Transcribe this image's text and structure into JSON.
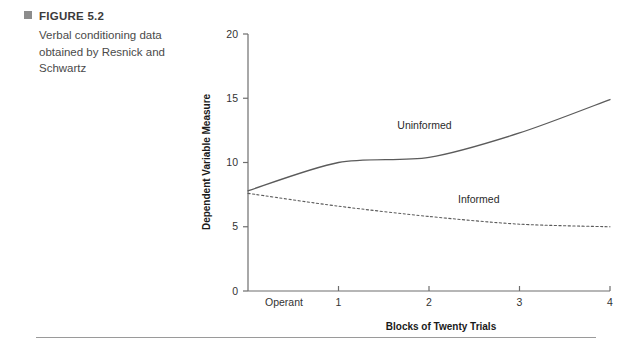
{
  "figure": {
    "bullet_icon": "square-bullet-icon",
    "title": "FIGURE 5.2",
    "description": "Verbal conditioning data obtained by Resnick and Schwartz"
  },
  "footer": {
    "faint_text": ""
  },
  "colors": {
    "axis": "#6e6e6e",
    "line": "#5b5b5b",
    "bullet": "#8c8c8c",
    "text": "#231f20"
  },
  "chart_data": {
    "type": "line",
    "title": "",
    "xlabel": "Blocks of Twenty Trials",
    "ylabel": "Dependent Variable Measure",
    "categories": [
      "Operant",
      "1",
      "2",
      "3",
      "4"
    ],
    "x": [
      0,
      1,
      2,
      3,
      4
    ],
    "xtick_labels": [
      "Operant",
      "1",
      "2",
      "3",
      "4"
    ],
    "ytick_labels": [
      "0",
      "5",
      "10",
      "15",
      "20"
    ],
    "yticks": [
      0,
      5,
      10,
      15,
      20
    ],
    "ylim": [
      0,
      20
    ],
    "xlim": [
      0,
      4
    ],
    "grid": false,
    "legend": "inline-annotations",
    "series": [
      {
        "name": "Uninformed",
        "style": "solid",
        "values": [
          7.8,
          10.0,
          10.4,
          12.3,
          14.9
        ],
        "label_x": 1.95,
        "label_y": 12.6
      },
      {
        "name": "Informed",
        "style": "dashed",
        "values": [
          7.6,
          6.6,
          5.8,
          5.2,
          5.0
        ],
        "label_x": 2.55,
        "label_y": 6.85
      }
    ]
  }
}
